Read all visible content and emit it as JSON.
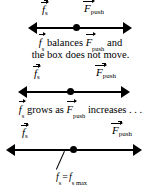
{
  "figure": {
    "background_color": "#ffffff",
    "ink_color": "#000000"
  },
  "panels": [
    {
      "id": "panel-1",
      "left_force_label": {
        "symbol": "f",
        "subscript": "s",
        "vector": true
      },
      "right_force_label": {
        "symbol": "F",
        "subscript": "push",
        "vector": true
      },
      "arrow": {
        "type": "double-headed",
        "left_x": 28,
        "right_x": 132,
        "dot_x": 76
      },
      "caption_line_1": "balances",
      "caption_line_1_tail": "and",
      "caption_line_2": "the box does not move."
    },
    {
      "id": "panel-2",
      "left_force_label": {
        "symbol": "f",
        "subscript": "s",
        "vector": true
      },
      "right_force_label": {
        "symbol": "F",
        "subscript": "push",
        "vector": true
      },
      "arrow": {
        "type": "double-headed",
        "left_x": 18,
        "right_x": 130,
        "dot_x": 70
      },
      "caption_line_1": "grows as",
      "caption_line_1_tail": "increases . . ."
    },
    {
      "id": "panel-3",
      "left_force_label": {
        "symbol": "f",
        "subscript": "s",
        "vector": true
      },
      "right_force_label": {
        "symbol": "F",
        "subscript": "push",
        "vector": true
      },
      "arrow": {
        "type": "double-headed",
        "left_x": 6,
        "right_x": 142,
        "dot_x": 70
      },
      "annotation": {
        "lhs_symbol": "f",
        "lhs_subscript": "s",
        "equals": "=",
        "rhs_symbol": "f",
        "rhs_subscript": "s max"
      }
    }
  ]
}
